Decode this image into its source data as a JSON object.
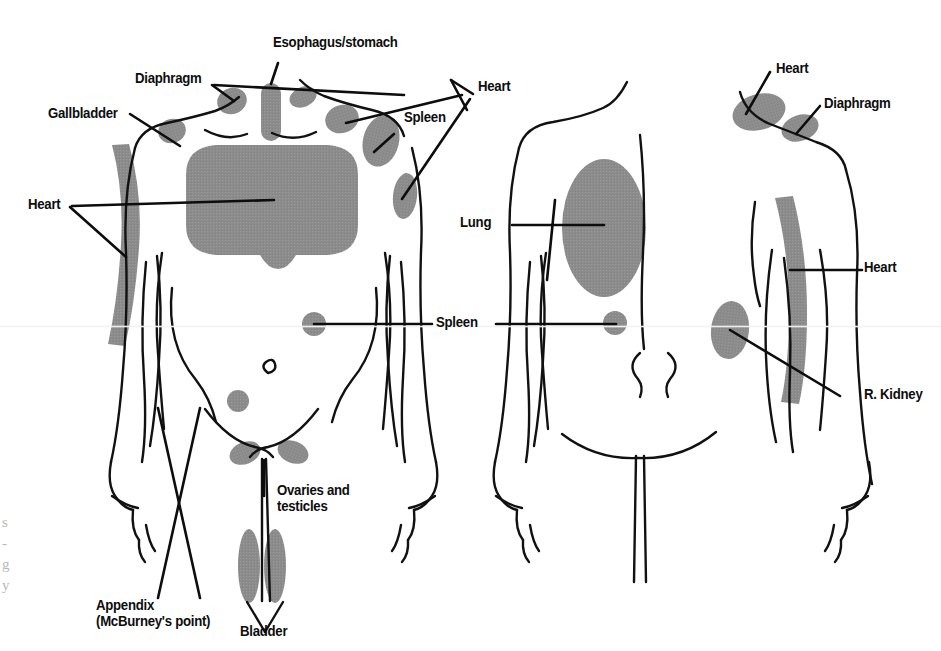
{
  "figure": {
    "colors": {
      "shade": "#8c8c8c",
      "outline": "#111111",
      "leader": "#0d0d0d",
      "background": "#ffffff",
      "text": "#0d0d0d"
    },
    "views": [
      {
        "name": "anterior",
        "label": "Anterior view"
      },
      {
        "name": "posterior",
        "label": "Posterior view"
      }
    ]
  },
  "labels": {
    "esophagus_stomach": "Esophagus/stomach",
    "diaphragm_anterior": "Diaphragm",
    "gallbladder": "Gallbladder",
    "spleen_shoulder": "Spleen",
    "heart_left_arm": "Heart",
    "spleen_flank": "Spleen",
    "ovaries_testicles": "Ovaries and\ntesticles",
    "appendix": "Appendix\n(McBurney's point)",
    "bladder": "Bladder",
    "lung": "Lung",
    "heart_posterior_left": "Heart",
    "heart_posterior_shoulder": "Heart",
    "diaphragm_posterior": "Diaphragm",
    "heart_posterior_flank": "Heart",
    "r_kidney": "R. Kidney"
  },
  "edge_fragments": {
    "left_column": "s\n-\ng\ny"
  },
  "pain_regions": {
    "anterior": [
      {
        "organ": "Diaphragm",
        "site": "left supraclavicular / trapezius ridge"
      },
      {
        "organ": "Esophagus/stomach",
        "site": "midline sternal notch strip"
      },
      {
        "organ": "Gallbladder",
        "site": "right shoulder tip"
      },
      {
        "organ": "Spleen",
        "site": "left shoulder and left upper arm"
      },
      {
        "organ": "Heart",
        "site": "central chest plus left inner arm"
      },
      {
        "organ": "Spleen",
        "site": "both lateral flanks"
      },
      {
        "organ": "Appendix (McBurney's point)",
        "site": "right lower quadrant point"
      },
      {
        "organ": "Ovaries and testicles",
        "site": "bilateral inguinal / groin ovals"
      },
      {
        "organ": "Bladder",
        "site": "suprapubic paired ovals"
      }
    ],
    "posterior": [
      {
        "organ": "Lung",
        "site": "left upper back large oval"
      },
      {
        "organ": "Spleen",
        "site": "left posterior flank spot"
      },
      {
        "organ": "Heart",
        "site": "left posterior shoulder / scapula"
      },
      {
        "organ": "Diaphragm",
        "site": "lateral to heart patch on shoulder"
      },
      {
        "organ": "Heart",
        "site": "right inner arm strip"
      },
      {
        "organ": "R. Kidney",
        "site": "right posterior flank oval"
      }
    ]
  }
}
